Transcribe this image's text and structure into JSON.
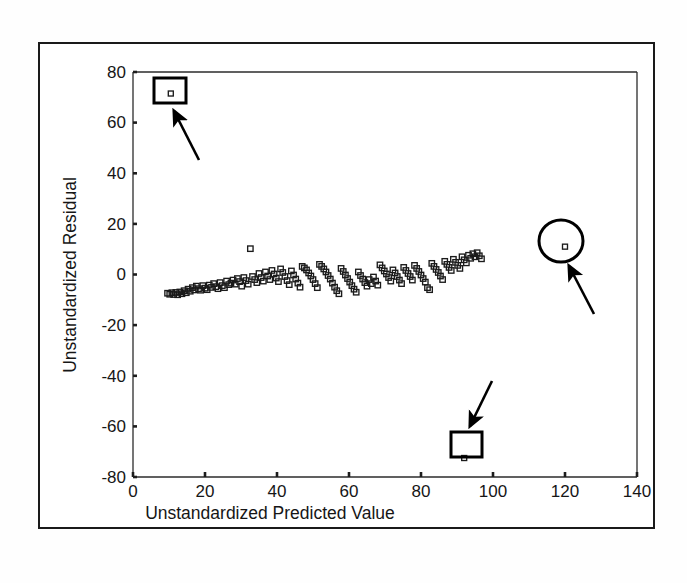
{
  "figure": {
    "type": "residual-scatter-plot",
    "background_color": "#ffffff",
    "frame_color": "#1a1a1a",
    "marker_color": "#1b1b1b",
    "annotation_color": "#000000"
  },
  "chart_data": {
    "type": "scatter",
    "title": "",
    "xlabel": "Unstandardized Predicted Value",
    "ylabel": "Unstandardized Residual",
    "xlim": [
      0,
      140
    ],
    "ylim": [
      -80,
      80
    ],
    "xticks": [
      0,
      20,
      40,
      60,
      80,
      100,
      120,
      140
    ],
    "yticks": [
      -80,
      -60,
      -40,
      -20,
      0,
      20,
      40,
      60,
      80
    ],
    "xtick_labels": [
      "0",
      "20",
      "40",
      "60",
      "80",
      "100",
      "120",
      "140"
    ],
    "ytick_labels": [
      "-80",
      "-60",
      "-40",
      "-20",
      "0",
      "20",
      "40",
      "60",
      "80"
    ],
    "grid": false,
    "legend": false,
    "marker": "open-square",
    "points": [
      [
        9.6,
        -7.4
      ],
      [
        10.2,
        -7.8
      ],
      [
        10.8,
        -7.2
      ],
      [
        11.3,
        -7.9
      ],
      [
        11.9,
        -7.1
      ],
      [
        12.4,
        -8.0
      ],
      [
        13.0,
        -6.9
      ],
      [
        13.6,
        -7.6
      ],
      [
        14.2,
        -6.4
      ],
      [
        14.8,
        -7.2
      ],
      [
        15.3,
        -5.8
      ],
      [
        15.9,
        -6.6
      ],
      [
        16.5,
        -5.2
      ],
      [
        17.1,
        -6.1
      ],
      [
        17.6,
        -4.6
      ],
      [
        18.2,
        -5.6
      ],
      [
        18.8,
        -6.2
      ],
      [
        19.4,
        -4.4
      ],
      [
        20.0,
        -5.4
      ],
      [
        20.6,
        -6.0
      ],
      [
        21.2,
        -4.2
      ],
      [
        21.8,
        -5.1
      ],
      [
        22.4,
        -3.6
      ],
      [
        23.0,
        -4.8
      ],
      [
        23.6,
        -5.6
      ],
      [
        24.2,
        -3.2
      ],
      [
        24.8,
        -4.4
      ],
      [
        25.4,
        -5.2
      ],
      [
        26.0,
        -2.6
      ],
      [
        26.6,
        -4.0
      ],
      [
        27.2,
        -3.4
      ],
      [
        27.8,
        -2.2
      ],
      [
        28.4,
        -3.8
      ],
      [
        29.0,
        -1.6
      ],
      [
        29.6,
        -2.8
      ],
      [
        30.2,
        -4.6
      ],
      [
        30.8,
        -1.2
      ],
      [
        31.4,
        -2.4
      ],
      [
        32.0,
        -3.8
      ],
      [
        32.6,
        10.2
      ],
      [
        33.2,
        -0.8
      ],
      [
        33.8,
        -2.0
      ],
      [
        34.4,
        -3.2
      ],
      [
        35.0,
        0.4
      ],
      [
        35.6,
        -1.2
      ],
      [
        36.2,
        -2.6
      ],
      [
        36.8,
        1.0
      ],
      [
        37.4,
        -0.6
      ],
      [
        38.0,
        -2.0
      ],
      [
        38.6,
        1.6
      ],
      [
        39.2,
        0.2
      ],
      [
        39.8,
        -1.4
      ],
      [
        40.4,
        -2.8
      ],
      [
        41.0,
        2.2
      ],
      [
        41.6,
        0.8
      ],
      [
        42.2,
        -0.8
      ],
      [
        42.8,
        -2.4
      ],
      [
        43.4,
        -4.0
      ],
      [
        44.0,
        1.4
      ],
      [
        44.6,
        -0.2
      ],
      [
        45.2,
        -1.8
      ],
      [
        45.8,
        -3.4
      ],
      [
        46.4,
        -5.0
      ],
      [
        47.0,
        3.2
      ],
      [
        47.6,
        2.6
      ],
      [
        48.2,
        1.8
      ],
      [
        48.8,
        0.6
      ],
      [
        49.4,
        -0.6
      ],
      [
        50.0,
        -2.0
      ],
      [
        50.6,
        -3.6
      ],
      [
        51.2,
        -5.2
      ],
      [
        51.8,
        4.0
      ],
      [
        52.4,
        3.2
      ],
      [
        53.0,
        2.2
      ],
      [
        53.6,
        1.0
      ],
      [
        54.2,
        -0.4
      ],
      [
        54.8,
        -1.8
      ],
      [
        55.4,
        -3.4
      ],
      [
        56.0,
        -5.0
      ],
      [
        56.6,
        -6.4
      ],
      [
        57.2,
        -7.6
      ],
      [
        57.8,
        2.4
      ],
      [
        58.4,
        1.2
      ],
      [
        59.0,
        -0.2
      ],
      [
        59.6,
        -1.6
      ],
      [
        60.2,
        -3.0
      ],
      [
        60.8,
        -4.4
      ],
      [
        61.4,
        -5.8
      ],
      [
        62.0,
        -7.0
      ],
      [
        62.6,
        1.0
      ],
      [
        63.2,
        -0.4
      ],
      [
        63.8,
        -1.8
      ],
      [
        64.4,
        -3.2
      ],
      [
        65.0,
        -4.6
      ],
      [
        65.6,
        -2.0
      ],
      [
        66.2,
        -3.6
      ],
      [
        66.8,
        -1.0
      ],
      [
        67.4,
        -2.6
      ],
      [
        68.0,
        -4.2
      ],
      [
        68.6,
        3.8
      ],
      [
        69.2,
        2.6
      ],
      [
        69.8,
        1.4
      ],
      [
        70.4,
        0.2
      ],
      [
        71.0,
        -1.2
      ],
      [
        71.6,
        -2.6
      ],
      [
        72.2,
        1.8
      ],
      [
        72.8,
        0.6
      ],
      [
        73.4,
        -0.8
      ],
      [
        74.0,
        -2.2
      ],
      [
        74.6,
        -3.6
      ],
      [
        75.2,
        2.8
      ],
      [
        75.8,
        1.6
      ],
      [
        76.4,
        0.4
      ],
      [
        77.0,
        -0.8
      ],
      [
        77.6,
        -2.2
      ],
      [
        78.2,
        3.6
      ],
      [
        78.8,
        2.4
      ],
      [
        79.4,
        1.2
      ],
      [
        80.0,
        -0.2
      ],
      [
        80.6,
        -1.6
      ],
      [
        81.2,
        -3.0
      ],
      [
        81.8,
        -5.2
      ],
      [
        82.4,
        -6.0
      ],
      [
        83.0,
        4.4
      ],
      [
        83.6,
        3.2
      ],
      [
        84.2,
        2.0
      ],
      [
        84.8,
        0.8
      ],
      [
        85.4,
        -0.6
      ],
      [
        86.0,
        -2.0
      ],
      [
        86.6,
        5.2
      ],
      [
        87.2,
        4.0
      ],
      [
        87.8,
        2.8
      ],
      [
        88.4,
        1.6
      ],
      [
        89.0,
        6.0
      ],
      [
        89.6,
        4.8
      ],
      [
        90.2,
        3.6
      ],
      [
        90.8,
        2.4
      ],
      [
        91.4,
        7.0
      ],
      [
        92.0,
        5.8
      ],
      [
        92.6,
        4.6
      ],
      [
        93.2,
        7.6
      ],
      [
        93.8,
        6.4
      ],
      [
        94.4,
        8.2
      ],
      [
        95.0,
        7.0
      ],
      [
        95.6,
        8.6
      ],
      [
        96.2,
        7.4
      ],
      [
        96.8,
        6.2
      ]
    ],
    "outliers": [
      {
        "x": 10.5,
        "y": 71.5,
        "label": "high positive residual outlier"
      },
      {
        "x": 92.0,
        "y": -72.5,
        "label": "high negative residual outlier"
      },
      {
        "x": 120.0,
        "y": 11.0,
        "label": "extreme predicted value outlier"
      }
    ],
    "annotations": [
      {
        "shape": "rectangle",
        "target": "outlier-top-left",
        "arrow": true
      },
      {
        "shape": "rectangle",
        "target": "outlier-bottom",
        "arrow": true
      },
      {
        "shape": "circle",
        "target": "outlier-right",
        "arrow": true
      }
    ]
  }
}
